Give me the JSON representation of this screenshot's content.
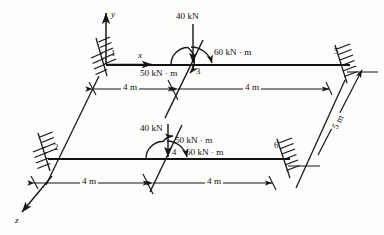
{
  "figure": {
    "type": "structural-frame-free-body-diagram"
  },
  "axes": {
    "y": {
      "label": "y",
      "direction": "up"
    },
    "x": {
      "label": "x",
      "direction": "right"
    },
    "z": {
      "label": "z",
      "direction": "down-left"
    }
  },
  "nodes": [
    {
      "id": "1",
      "label": "1",
      "support": "fixed",
      "beam": "upper",
      "position": "left-end"
    },
    {
      "id": "2",
      "label": "2",
      "support": "fixed",
      "beam": "lower",
      "position": "left-end"
    },
    {
      "id": "3",
      "label": "3",
      "support": "free",
      "beam": "upper",
      "position": "mid"
    },
    {
      "id": "4",
      "label": "4",
      "support": "free",
      "beam": "lower",
      "position": "mid"
    },
    {
      "id": "5",
      "label": "5",
      "support": "fixed",
      "beam": "upper",
      "position": "right-end"
    },
    {
      "id": "6",
      "label": "6",
      "support": "fixed",
      "beam": "lower",
      "position": "right-end"
    }
  ],
  "loads": {
    "upper": {
      "point_load": "40 kN",
      "moment_left": "50 kN · m",
      "moment_right": "60 kN · m"
    },
    "lower": {
      "point_load": "40 kN",
      "moment_left": "50 kN · m",
      "moment_right": "60 kN · m"
    }
  },
  "dimensions": {
    "upper_left_span": "4 m",
    "upper_right_span": "4 m",
    "lower_left_span": "4 m",
    "lower_right_span": "4 m",
    "depth": "5 m"
  },
  "colors": {
    "line": "#1a1a1a",
    "beam": "#111111",
    "background": "#fdfdfc"
  }
}
